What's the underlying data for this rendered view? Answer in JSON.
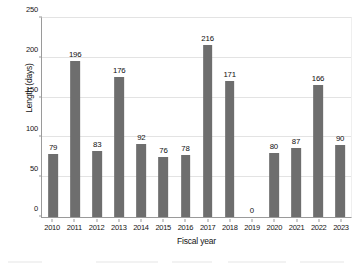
{
  "chart_data": {
    "type": "bar",
    "title": "",
    "xlabel": "Fiscal year",
    "ylabel": "Length (days)",
    "categories": [
      "2010",
      "2011",
      "2012",
      "2013",
      "2014",
      "2015",
      "2016",
      "2017",
      "2018",
      "2019",
      "2020",
      "2021",
      "2022",
      "2023"
    ],
    "values": [
      79,
      196,
      83,
      176,
      92,
      76,
      78,
      216,
      171,
      0,
      80,
      87,
      166,
      90
    ],
    "value_labels": [
      "79",
      "196",
      "83",
      "176",
      "92",
      "76",
      "78",
      "216",
      "171",
      "0",
      "80",
      "87",
      "166",
      "90"
    ],
    "ylim": [
      0,
      250
    ],
    "yticks": [
      0,
      50,
      100,
      150,
      200,
      250
    ],
    "ytick_labels": [
      "0",
      "50",
      "100",
      "150",
      "200",
      "250"
    ],
    "grid": "horizontal",
    "legend": "none",
    "series": [
      {
        "name": "Length (days)",
        "color": "#6e6e6e",
        "values": [
          79,
          196,
          83,
          176,
          92,
          76,
          78,
          216,
          171,
          0,
          80,
          87,
          166,
          90
        ]
      }
    ]
  },
  "style": {
    "bar_color": "#6e6e6e",
    "grid_color": "#e3e3e3",
    "axis_color": "#9a9a9a",
    "text_color": "#141414",
    "background": "#ffffff"
  }
}
